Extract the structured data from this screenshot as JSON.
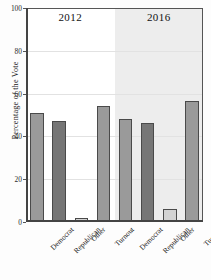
{
  "chart_data": {
    "type": "bar",
    "title": "",
    "xlabel": "",
    "ylabel": "Percentage of the Vote",
    "ylim": [
      0,
      100
    ],
    "yticks": [
      0,
      20,
      40,
      60,
      80,
      100
    ],
    "ytick_labels": [
      "0",
      "20",
      "40",
      "60",
      "80",
      "100"
    ],
    "grid": true,
    "legend": "none",
    "panels": [
      {
        "label": "2012",
        "categories": [
          "Democrat",
          "Republican",
          "Other",
          "Turnout"
        ],
        "values": [
          51,
          47,
          2,
          54
        ]
      },
      {
        "label": "2016",
        "categories": [
          "Democrat",
          "Republican",
          "Other",
          "Turnout"
        ],
        "values": [
          48,
          46.5,
          6,
          56.5
        ]
      }
    ],
    "colors": {
      "democrat": "#9a9a9a",
      "republican": "#767676",
      "other": "#d3d3d3",
      "turnout": "#9a9a9a",
      "bar_edge": "#4a4a4a",
      "panel_bg_2012": "#ffffff",
      "panel_bg_2016": "#ededed",
      "grid": "#e2e2e2",
      "axis": "#444444"
    }
  }
}
